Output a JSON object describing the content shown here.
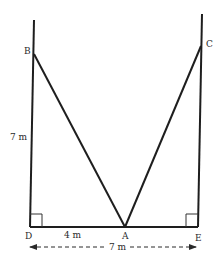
{
  "diagram": {
    "stroke_color": "#1e1e1e",
    "points": {
      "B": {
        "label": "B",
        "x": 34,
        "y": 54
      },
      "C": {
        "label": "C",
        "x": 202,
        "y": 46
      },
      "D": {
        "label": "D",
        "x": 30,
        "y": 227
      },
      "A": {
        "label": "A",
        "x": 125,
        "y": 227
      },
      "E": {
        "label": "E",
        "x": 198,
        "y": 227
      }
    },
    "measurements": {
      "BD": "7 m",
      "DA": "4 m",
      "DE": "7 m"
    }
  }
}
